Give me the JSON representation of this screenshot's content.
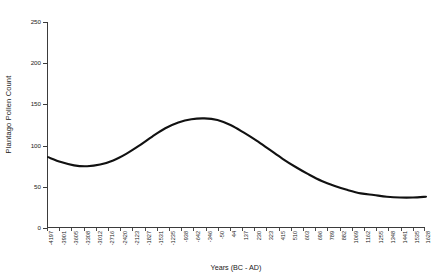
{
  "chart_data": {
    "type": "line",
    "title": "",
    "xlabel": "Years (BC - AD)",
    "ylabel": "Plantago Pollen Count",
    "ylim": [
      0,
      250
    ],
    "ytick_labels": [
      "0",
      "50",
      "100",
      "150",
      "200",
      "250"
    ],
    "ytick_values": [
      0,
      50,
      100,
      150,
      200,
      250
    ],
    "grid": false,
    "legend": false,
    "line_color": "#111111",
    "categories": [
      "-4197",
      "-3901",
      "-3605",
      "-3308",
      "-3012",
      "-2716",
      "-2420",
      "-2123",
      "-1827",
      "-1531",
      "-1235",
      "-938",
      "-642",
      "-346",
      "-50",
      "137",
      "44",
      "230",
      "415",
      "510",
      "603",
      "789",
      "882",
      "1069",
      "1162",
      "1255",
      "1348",
      "1441",
      "1535",
      "1628"
    ],
    "x_tick_labels": [
      "-4197",
      "-3901",
      "-3605",
      "-3308",
      "-3012",
      "-2716",
      "-2420",
      "-2123",
      "-1827",
      "-1531",
      "-1235",
      "-938",
      "-642",
      "-346",
      "-50",
      "44",
      "137",
      "230",
      "323",
      "415",
      "510",
      "603",
      "696",
      "789",
      "882",
      "1069",
      "1162",
      "1255",
      "1348",
      "1441",
      "1535",
      "1628"
    ],
    "values": [
      86,
      80,
      76,
      75,
      77,
      82,
      90,
      100,
      111,
      121,
      128,
      132,
      133,
      131,
      125,
      116,
      106,
      95,
      84,
      74,
      65,
      57,
      51,
      46,
      42,
      40,
      38,
      37,
      37,
      38
    ],
    "annotations": []
  },
  "axis": {
    "y_title": "Plantago Pollen Count",
    "x_title": "Years (BC - AD)"
  }
}
